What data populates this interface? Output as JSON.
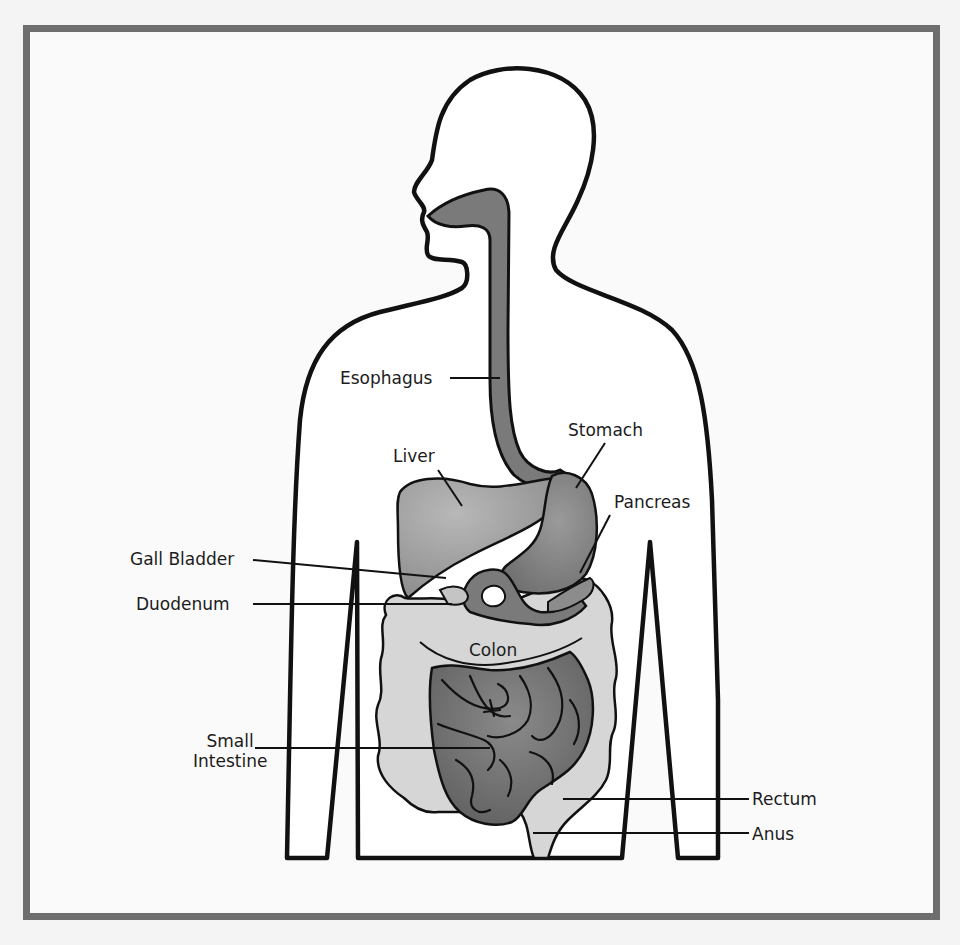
{
  "diagram": {
    "colors": {
      "frame": "#6e6e6e",
      "background": "#fafafa",
      "outline": "#111111",
      "esophagus": "#7a7a7a",
      "liver": "#9e9e9e",
      "stomach": "#808080",
      "duodenum": "#7a7a7a",
      "pancreas": "#8c8c8c",
      "colon": "#d6d6d6",
      "small_intestine": "#6f6f6f",
      "rectum": "#d0d0d0"
    },
    "labels": {
      "esophagus": "Esophagus",
      "stomach": "Stomach",
      "liver": "Liver",
      "pancreas": "Pancreas",
      "gall_bladder": "Gall Bladder",
      "duodenum": "Duodenum",
      "colon": "Colon",
      "small_intestine_line1": "Small",
      "small_intestine_line2": "Intestine",
      "rectum": "Rectum",
      "anus": "Anus"
    }
  }
}
